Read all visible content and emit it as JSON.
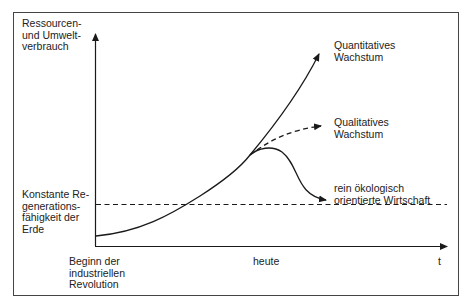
{
  "diagram": {
    "y_axis_label": "Ressourcen-\nund Umwelt-\nverbrauch",
    "x_axis_label": "t",
    "x_ticks": [
      {
        "label": "Beginn der\nindustriellen\nRevolution"
      },
      {
        "label": "heute"
      }
    ],
    "threshold_label": "Konstante Re-\ngenerations-\nfähigkeit der\nErde",
    "curves": [
      {
        "name": "quantitative-growth",
        "label": "Quantitatives\nWachstum",
        "style": "solid"
      },
      {
        "name": "qualitative-growth",
        "label": "Qualitatives\nWachstum",
        "style": "dashed"
      },
      {
        "name": "ecological-economy",
        "label": "rein ökologisch\norientierte Wirtschaft",
        "style": "solid"
      }
    ],
    "colors": {
      "line": "#1a1a1a",
      "frame": "#444444",
      "background": "#ffffff"
    }
  }
}
